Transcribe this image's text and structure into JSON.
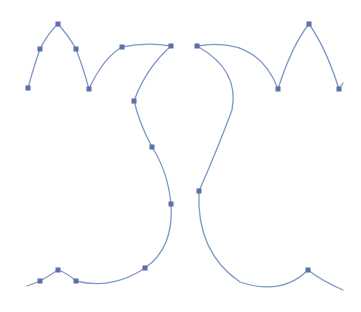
{
  "canvas": {
    "width": 361,
    "height": 312,
    "background": "#ffffff"
  },
  "colors": {
    "stroke": "#7f97c9",
    "anchor": "#5b6fa8"
  },
  "paths": [
    {
      "name": "left-top-m-shape",
      "d": "M28,88 Q34,66 40,49 Q48,33 58,24 Q68,35 76,49 Q83,67 89,89 Q103,58 122,47 Q146,42 171,46"
    },
    {
      "name": "left-s-curve",
      "d": "M171,46 Q146,68 134,101 Q140,125 152,147 Q168,172 171,204 Q174,248 145,268 Q112,290 76,281"
    },
    {
      "name": "left-bottom-bump",
      "d": "M76,281 Q67,273 58,270 Q49,276 40,281 Q33,284 27,286"
    },
    {
      "name": "right-top-m-shape",
      "d": "M197,46 Q258,36 278,89 Q292,45 309,24 Q326,48 339,89 Q341,86 343,83"
    },
    {
      "name": "right-s-curve",
      "d": "M197,46 Q240,70 232,110 Q218,148 199,191 Q196,252 240,282 Q282,296 308,270 Q322,281 343,290"
    }
  ],
  "anchors": [
    [
      28,
      88
    ],
    [
      40,
      49
    ],
    [
      58,
      24
    ],
    [
      76,
      49
    ],
    [
      89,
      89
    ],
    [
      122,
      47
    ],
    [
      171,
      46
    ],
    [
      134,
      101
    ],
    [
      152,
      147
    ],
    [
      171,
      204
    ],
    [
      145,
      268
    ],
    [
      76,
      281
    ],
    [
      58,
      270
    ],
    [
      40,
      281
    ],
    [
      197,
      46
    ],
    [
      278,
      89
    ],
    [
      309,
      24
    ],
    [
      339,
      89
    ],
    [
      199,
      191
    ],
    [
      308,
      270
    ]
  ]
}
